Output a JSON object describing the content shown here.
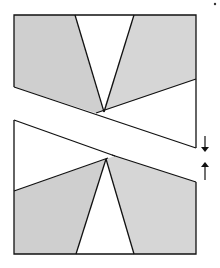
{
  "diagram": {
    "colors": {
      "shade_left": "#cfcfcf",
      "shade_right": "#d6d6d6",
      "line": "#111111",
      "background": "#ffffff"
    },
    "arrows": [
      {
        "name": "down-arrow",
        "direction": "down",
        "glyph": "↓"
      },
      {
        "name": "up-arrow",
        "direction": "up",
        "glyph": "↑"
      }
    ]
  }
}
